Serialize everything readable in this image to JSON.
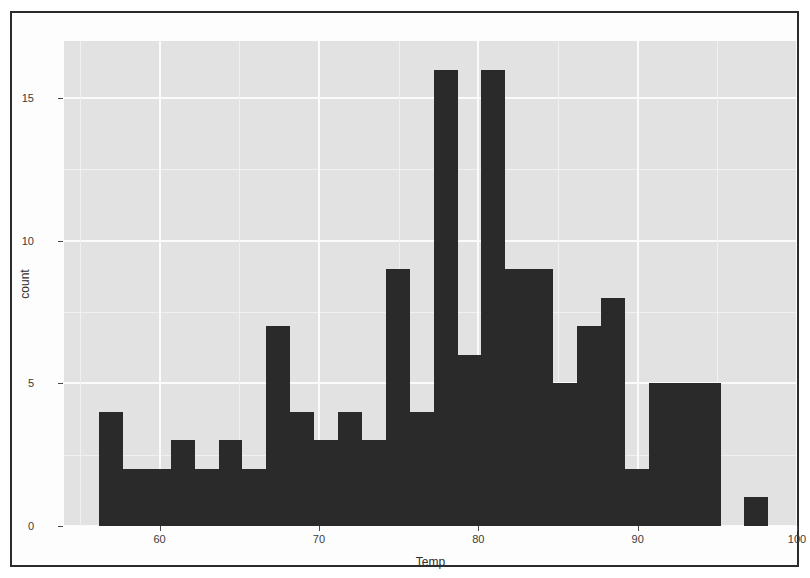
{
  "figure": {
    "kind": "histogram-plot",
    "background_color": "#ffffff",
    "panel_color": "#e2e2e2",
    "gridline_color": "#fbfbfb",
    "bar_color": "#2a2a2a",
    "frame_color": "#2b2b2b"
  },
  "chart_data": {
    "type": "bar",
    "subtype": "histogram",
    "title": "",
    "xlabel": "Temp",
    "ylabel": "count",
    "xlim": [
      54.0,
      100.0
    ],
    "ylim": [
      0,
      17
    ],
    "x_ticks": [
      60,
      70,
      80,
      90,
      100
    ],
    "y_ticks": [
      0,
      5,
      10,
      15
    ],
    "x_tick_labels": [
      "60",
      "70",
      "80",
      "90",
      "100"
    ],
    "y_tick_labels": [
      "0",
      "5",
      "10",
      "15"
    ],
    "grid": true,
    "legend": "none",
    "binwidth": 1.5,
    "bin_edges": [
      56.2,
      57.7,
      59.2,
      60.7,
      62.2,
      63.7,
      65.2,
      66.7,
      68.2,
      69.7,
      71.2,
      72.7,
      74.2,
      75.7,
      77.2,
      78.7,
      80.2,
      81.7,
      83.2,
      84.7,
      86.2,
      87.7,
      89.2,
      90.7,
      92.2,
      93.7,
      95.2,
      96.7,
      98.2
    ],
    "bin_centers": [
      56.95,
      58.45,
      59.95,
      61.45,
      62.95,
      64.45,
      65.95,
      67.45,
      68.95,
      70.45,
      71.95,
      73.45,
      74.95,
      76.45,
      77.95,
      79.45,
      80.95,
      82.45,
      83.95,
      85.45,
      86.95,
      88.45,
      89.95,
      91.45,
      92.95,
      94.45,
      95.95,
      97.45
    ],
    "categories": [
      "56.2-57.7",
      "57.7-59.2",
      "59.2-60.7",
      "60.7-62.2",
      "62.2-63.7",
      "63.7-65.2",
      "65.2-66.7",
      "66.7-68.2",
      "68.2-69.7",
      "69.7-71.2",
      "71.2-72.7",
      "72.7-74.2",
      "74.2-75.7",
      "75.7-77.2",
      "77.2-78.7",
      "78.7-80.2",
      "80.2-81.7",
      "81.7-83.2",
      "83.2-84.7",
      "84.7-86.2",
      "86.2-87.7",
      "87.7-89.2",
      "89.2-90.7",
      "90.7-92.2",
      "92.2-93.7",
      "93.7-95.2",
      "95.2-96.7",
      "96.7-98.2"
    ],
    "values": [
      4,
      2,
      2,
      3,
      2,
      3,
      2,
      7,
      4,
      3,
      4,
      3,
      9,
      4,
      16,
      6,
      16,
      9,
      9,
      5,
      7,
      8,
      2,
      5,
      5,
      5,
      0,
      1
    ]
  },
  "axes": {
    "x_title": "Temp",
    "y_title": "count"
  }
}
